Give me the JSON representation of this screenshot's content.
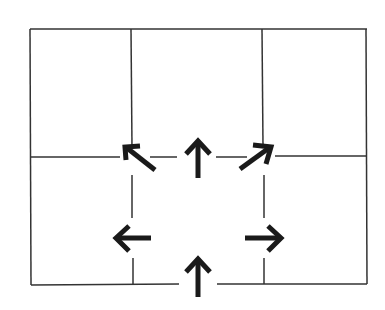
{
  "diagram": {
    "type": "grid-with-direction-arrows",
    "colors": {
      "background": "#ffffff",
      "line": "#333333",
      "arrow": "#1a1a1a"
    },
    "grid": {
      "outer": {
        "x1": 30,
        "y1": 29,
        "x2": 367,
        "y2": 285
      },
      "verticals": [
        132,
        263
      ],
      "horizontal": 157
    },
    "arrows": [
      {
        "name": "arrow-up-left",
        "direction": "up-left"
      },
      {
        "name": "arrow-up-center",
        "direction": "up"
      },
      {
        "name": "arrow-up-right",
        "direction": "up-right"
      },
      {
        "name": "arrow-left",
        "direction": "left"
      },
      {
        "name": "arrow-right",
        "direction": "right"
      },
      {
        "name": "arrow-up-bottom",
        "direction": "up"
      }
    ]
  }
}
